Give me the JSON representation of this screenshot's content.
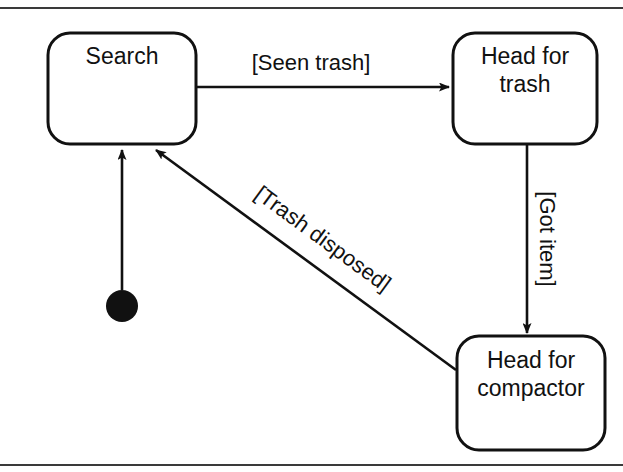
{
  "diagram": {
    "type": "uml-state-machine",
    "title": "",
    "states": [
      {
        "id": "search",
        "label": "Search",
        "label_line1": "Search",
        "label_line2": ""
      },
      {
        "id": "head-trash",
        "label": "Head for trash",
        "label_line1": "Head for",
        "label_line2": "trash"
      },
      {
        "id": "head-comp",
        "label": "Head for compactor",
        "label_line1": "Head for",
        "label_line2": "compactor"
      }
    ],
    "initial_state": {
      "id": "initial-pseudostate",
      "label": ""
    },
    "transitions": [
      {
        "id": "t-initial",
        "from": "initial-pseudostate",
        "to": "search",
        "guard": ""
      },
      {
        "id": "t-seen",
        "from": "search",
        "to": "head-trash",
        "guard": "[Seen trash]"
      },
      {
        "id": "t-got",
        "from": "head-trash",
        "to": "head-comp",
        "guard": "[Got item]"
      },
      {
        "id": "t-disp",
        "from": "head-comp",
        "to": "search",
        "guard": "[Trash disposed]"
      }
    ],
    "colors": {
      "line": "#111111",
      "fill": "#ffffff",
      "rule": "#3a3a3a",
      "background": "#ffffff"
    }
  }
}
